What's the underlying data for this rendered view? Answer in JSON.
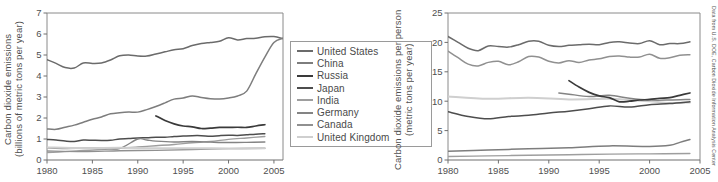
{
  "figure": {
    "credit": "Data from U.S. DOE, Carbon Dioxide Information Analysis Center",
    "caption_fragment": ""
  },
  "legend": {
    "entries": [
      {
        "label": "United States",
        "color": "#6b6b6b"
      },
      {
        "label": "China",
        "color": "#7d7d7d"
      },
      {
        "label": "Russia",
        "color": "#3a3a3a"
      },
      {
        "label": "Japan",
        "color": "#4d4d4d"
      },
      {
        "label": "India",
        "color": "#9e9e9e"
      },
      {
        "label": "Germany",
        "color": "#848484"
      },
      {
        "label": "Canada",
        "color": "#909090"
      },
      {
        "label": "United Kingdom",
        "color": "#cfcfcf"
      }
    ]
  },
  "chart_data": [
    {
      "id": "total-emissions",
      "type": "line",
      "title": "",
      "xlabel": "",
      "ylabel": "Carbon dioxide emissions (billions of metric tons per year)",
      "ylabel_line1": "Carbon dioxide emissions",
      "ylabel_line2": "(billions of metric tons per year)",
      "xlim": [
        1980,
        2006
      ],
      "ylim": [
        0,
        7
      ],
      "xticks": [
        1980,
        1985,
        1990,
        1995,
        2000,
        2005
      ],
      "yticks": [
        0,
        1,
        2,
        3,
        4,
        5,
        6,
        7
      ],
      "grid": false,
      "legend_position": "right-outside",
      "series": [
        {
          "name": "United States",
          "color": "#6b6b6b",
          "width": 1.5,
          "x": [
            1980,
            1981,
            1982,
            1983,
            1984,
            1985,
            1986,
            1987,
            1988,
            1989,
            1990,
            1991,
            1992,
            1993,
            1994,
            1995,
            1996,
            1997,
            1998,
            1999,
            2000,
            2001,
            2002,
            2003,
            2004,
            2005,
            2006
          ],
          "values": [
            4.78,
            4.6,
            4.4,
            4.38,
            4.62,
            4.6,
            4.62,
            4.76,
            4.96,
            5.0,
            4.95,
            4.95,
            5.05,
            5.15,
            5.25,
            5.3,
            5.45,
            5.55,
            5.6,
            5.65,
            5.82,
            5.72,
            5.78,
            5.8,
            5.87,
            5.88,
            5.78
          ]
        },
        {
          "name": "China",
          "color": "#7d7d7d",
          "width": 1.5,
          "x": [
            1980,
            1981,
            1982,
            1983,
            1984,
            1985,
            1986,
            1987,
            1988,
            1989,
            1990,
            1991,
            1992,
            1993,
            1994,
            1995,
            1996,
            1997,
            1998,
            1999,
            2000,
            2001,
            2002,
            2003,
            2004,
            2005,
            2006
          ],
          "values": [
            1.48,
            1.46,
            1.56,
            1.66,
            1.8,
            1.94,
            2.05,
            2.2,
            2.25,
            2.28,
            2.28,
            2.4,
            2.55,
            2.72,
            2.9,
            2.95,
            3.05,
            2.98,
            2.92,
            2.9,
            2.95,
            3.05,
            3.28,
            4.1,
            4.9,
            5.6,
            5.8
          ]
        },
        {
          "name": "Russia",
          "color": "#3a3a3a",
          "width": 1.7,
          "x": [
            1992,
            1993,
            1994,
            1995,
            1996,
            1997,
            1998,
            1999,
            2000,
            2001,
            2002,
            2003,
            2004
          ],
          "values": [
            2.1,
            1.88,
            1.72,
            1.62,
            1.58,
            1.5,
            1.52,
            1.55,
            1.55,
            1.56,
            1.55,
            1.62,
            1.68
          ]
        },
        {
          "name": "Japan",
          "color": "#4d4d4d",
          "width": 1.5,
          "x": [
            1980,
            1981,
            1982,
            1983,
            1984,
            1985,
            1986,
            1987,
            1988,
            1989,
            1990,
            1991,
            1992,
            1993,
            1994,
            1995,
            1996,
            1997,
            1998,
            1999,
            2000,
            2001,
            2002,
            2003,
            2004
          ],
          "values": [
            0.98,
            0.95,
            0.9,
            0.88,
            0.95,
            0.94,
            0.93,
            0.94,
            1.0,
            1.02,
            1.05,
            1.06,
            1.08,
            1.08,
            1.12,
            1.14,
            1.16,
            1.16,
            1.13,
            1.16,
            1.18,
            1.17,
            1.2,
            1.23,
            1.25
          ]
        },
        {
          "name": "India",
          "color": "#9e9e9e",
          "width": 1.4,
          "x": [
            1980,
            1982,
            1984,
            1986,
            1988,
            1990,
            1992,
            1994,
            1996,
            1998,
            2000,
            2002,
            2004
          ],
          "values": [
            0.35,
            0.4,
            0.45,
            0.5,
            0.56,
            0.62,
            0.68,
            0.74,
            0.82,
            0.88,
            0.98,
            1.05,
            1.12
          ]
        },
        {
          "name": "Germany",
          "color": "#848484",
          "width": 1.4,
          "x": [
            1980,
            1982,
            1984,
            1986,
            1988,
            1990,
            1991,
            1992,
            1994,
            1996,
            1998,
            2000,
            2002,
            2004
          ],
          "values": [
            0.58,
            0.55,
            0.56,
            0.56,
            0.55,
            1.0,
            0.95,
            0.9,
            0.86,
            0.88,
            0.85,
            0.83,
            0.84,
            0.86
          ]
        },
        {
          "name": "Canada",
          "color": "#909090",
          "width": 1.4,
          "x": [
            1980,
            1984,
            1988,
            1992,
            1996,
            2000,
            2004
          ],
          "values": [
            0.43,
            0.4,
            0.44,
            0.46,
            0.5,
            0.54,
            0.56
          ]
        },
        {
          "name": "United Kingdom",
          "color": "#cfcfcf",
          "width": 2.0,
          "x": [
            1980,
            1984,
            1988,
            1992,
            1996,
            2000,
            2004
          ],
          "values": [
            0.6,
            0.56,
            0.58,
            0.56,
            0.56,
            0.55,
            0.56
          ]
        }
      ]
    },
    {
      "id": "per-capita-emissions",
      "type": "line",
      "title": "",
      "xlabel": "",
      "ylabel": "Carbon dioxide emissions per person (metric tons per year)",
      "ylabel_line1": "Carbon dioxide emissions per person",
      "ylabel_line2": "(metric tons per year)",
      "xlim": [
        1980,
        2005
      ],
      "ylim": [
        0,
        25
      ],
      "xticks": [
        1980,
        1985,
        1990,
        1995,
        2000,
        2005
      ],
      "yticks": [
        0,
        5,
        10,
        15,
        20,
        25
      ],
      "grid": false,
      "legend_position": "shared-left-chart",
      "series": [
        {
          "name": "United States",
          "color": "#6b6b6b",
          "width": 1.5,
          "x": [
            1980,
            1981,
            1982,
            1983,
            1984,
            1985,
            1986,
            1987,
            1988,
            1989,
            1990,
            1991,
            1992,
            1993,
            1994,
            1995,
            1996,
            1997,
            1998,
            1999,
            2000,
            2001,
            2002,
            2003,
            2004
          ],
          "values": [
            21.0,
            20.0,
            19.0,
            18.6,
            19.4,
            19.3,
            19.2,
            19.6,
            20.2,
            20.2,
            19.5,
            19.3,
            19.5,
            19.6,
            19.7,
            19.6,
            20.0,
            20.1,
            19.9,
            19.8,
            20.3,
            19.6,
            19.8,
            19.8,
            20.1
          ]
        },
        {
          "name": "Canada",
          "color": "#909090",
          "width": 1.5,
          "x": [
            1980,
            1981,
            1982,
            1983,
            1984,
            1985,
            1986,
            1987,
            1988,
            1989,
            1990,
            1991,
            1992,
            1993,
            1994,
            1995,
            1996,
            1997,
            1998,
            1999,
            2000,
            2001,
            2002,
            2003,
            2004
          ],
          "values": [
            18.5,
            17.4,
            16.3,
            16.0,
            16.6,
            16.8,
            16.2,
            16.7,
            17.6,
            17.5,
            16.8,
            16.5,
            16.9,
            16.6,
            17.0,
            17.2,
            17.6,
            17.7,
            17.5,
            17.5,
            18.0,
            17.3,
            17.4,
            17.8,
            17.9
          ]
        },
        {
          "name": "United Kingdom",
          "color": "#cfcfcf",
          "width": 2.0,
          "x": [
            1980,
            1984,
            1988,
            1992,
            1996,
            1998,
            2000,
            2002,
            2004
          ],
          "values": [
            10.8,
            10.4,
            10.6,
            10.3,
            10.4,
            10.2,
            10.0,
            9.7,
            9.8
          ]
        },
        {
          "name": "Germany",
          "color": "#848484",
          "width": 1.5,
          "x": [
            1991,
            1992,
            1994,
            1996,
            1998,
            2000,
            2002,
            2004
          ],
          "values": [
            11.4,
            11.2,
            10.8,
            11.0,
            10.5,
            10.2,
            10.2,
            10.3
          ]
        },
        {
          "name": "Russia",
          "color": "#3a3a3a",
          "width": 1.7,
          "x": [
            1992,
            1993,
            1994,
            1995,
            1996,
            1997,
            1998,
            1999,
            2000,
            2001,
            2002,
            2003,
            2004
          ],
          "values": [
            13.5,
            12.4,
            11.5,
            10.9,
            10.6,
            9.9,
            10.0,
            10.2,
            10.3,
            10.5,
            10.6,
            11.0,
            11.4
          ]
        },
        {
          "name": "Japan",
          "color": "#4d4d4d",
          "width": 1.5,
          "x": [
            1980,
            1982,
            1984,
            1986,
            1988,
            1990,
            1992,
            1994,
            1996,
            1998,
            2000,
            2002,
            2004
          ],
          "values": [
            8.2,
            7.4,
            7.0,
            7.4,
            7.6,
            8.0,
            8.3,
            8.7,
            9.2,
            9.0,
            9.4,
            9.6,
            9.9
          ]
        },
        {
          "name": "China",
          "color": "#7d7d7d",
          "width": 1.5,
          "x": [
            1980,
            1984,
            1988,
            1992,
            1996,
            2000,
            2002,
            2003,
            2004
          ],
          "values": [
            1.5,
            1.7,
            1.9,
            2.1,
            2.4,
            2.3,
            2.5,
            3.0,
            3.5
          ]
        },
        {
          "name": "India",
          "color": "#9e9e9e",
          "width": 1.4,
          "x": [
            1980,
            1984,
            1988,
            1992,
            1996,
            2000,
            2004
          ],
          "values": [
            0.6,
            0.7,
            0.8,
            0.9,
            1.0,
            1.05,
            1.1
          ]
        }
      ]
    }
  ]
}
